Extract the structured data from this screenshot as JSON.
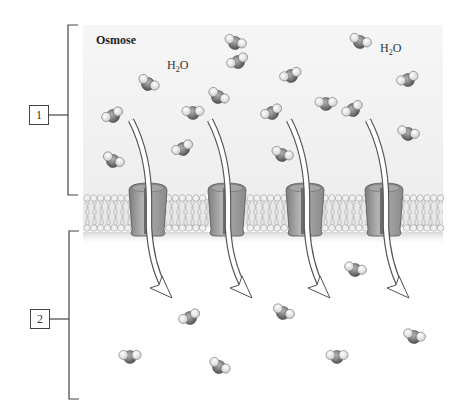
{
  "diagram": {
    "title": "Osmose",
    "labels": [
      {
        "id": "1",
        "text": "1",
        "region": "upper compartment"
      },
      {
        "id": "2",
        "text": "2",
        "region": "lower compartment"
      }
    ],
    "molecule_labels": [
      {
        "text_main": "H",
        "text_sub": "2",
        "text_tail": "O"
      },
      {
        "text_main": "H",
        "text_sub": "2",
        "text_tail": "O"
      }
    ],
    "elements": {
      "membrane": "phospholipid-bilayer",
      "channels": 4,
      "arrows": 4,
      "water_molecules_upper": 16,
      "water_molecules_lower": 9
    },
    "colors": {
      "upper_background": "#f0f0f0",
      "membrane_head": "#e6e6e6",
      "channel": "#9a9a9a",
      "oxygen": "#7a7a7a",
      "hydrogen": "#f2f2f2",
      "outline": "#444444"
    }
  }
}
